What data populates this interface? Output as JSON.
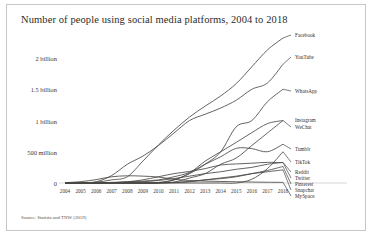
{
  "title": "Number of people using social media platforms, 2004 to 2018",
  "source": "Source: Statista and TNW (2019)",
  "chart_data": {
    "type": "line",
    "title": "Number of people using social media platforms, 2004 to 2018",
    "xlabel": "",
    "ylabel": "",
    "grid": false,
    "legend_position": "right-inline-labels",
    "xlim": [
      2004,
      2018
    ],
    "ylim": [
      0,
      2400
    ],
    "y_unit": "millions of users",
    "y_ticks": [
      0,
      500,
      1000,
      1500,
      2000
    ],
    "y_tick_labels": [
      "0",
      "500 million",
      "1 billion",
      "1.5 billion",
      "2 billion"
    ],
    "x": [
      2004,
      2005,
      2006,
      2007,
      2008,
      2009,
      2010,
      2011,
      2012,
      2013,
      2014,
      2015,
      2016,
      2017,
      2018
    ],
    "x_tick_labels": [
      "2004",
      "2005",
      "2006",
      "2007",
      "2008",
      "2009",
      "2010",
      "2011",
      "2012",
      "2013",
      "2014",
      "2015",
      "2016",
      "2017",
      "2018"
    ],
    "series": [
      {
        "name": "Facebook",
        "values": [
          0,
          6,
          12,
          50,
          100,
          350,
          608,
          845,
          1056,
          1230,
          1393,
          1591,
          1860,
          2129,
          2320
        ]
      },
      {
        "name": "YouTube",
        "values": [
          0,
          0,
          20,
          120,
          300,
          430,
          600,
          800,
          1000,
          1100,
          1200,
          1325,
          1500,
          1600,
          1900
        ]
      },
      {
        "name": "WhatsApp",
        "values": [
          0,
          0,
          0,
          0,
          0,
          0,
          10,
          50,
          150,
          300,
          500,
          900,
          1000,
          1300,
          1500
        ]
      },
      {
        "name": "Instagram",
        "values": [
          0,
          0,
          0,
          0,
          0,
          0,
          1,
          15,
          80,
          150,
          300,
          400,
          600,
          800,
          1000
        ]
      },
      {
        "name": "WeChat",
        "values": [
          0,
          0,
          0,
          0,
          0,
          0,
          0,
          50,
          160,
          350,
          500,
          650,
          806,
          950,
          1000
        ]
      },
      {
        "name": "Tumblr",
        "values": [
          0,
          0,
          0,
          10,
          20,
          30,
          50,
          100,
          170,
          300,
          420,
          555,
          550,
          500,
          620
        ]
      },
      {
        "name": "TikTok",
        "values": [
          0,
          0,
          0,
          0,
          0,
          0,
          0,
          0,
          0,
          0,
          0,
          0,
          60,
          230,
          500
        ]
      },
      {
        "name": "Reddit",
        "values": [
          0,
          0,
          0,
          5,
          10,
          20,
          40,
          70,
          110,
          150,
          180,
          220,
          250,
          300,
          330
        ]
      },
      {
        "name": "Twitter",
        "values": [
          0,
          0,
          0,
          5,
          20,
          50,
          100,
          150,
          185,
          230,
          288,
          305,
          317,
          330,
          326
        ]
      },
      {
        "name": "Pinterest",
        "values": [
          0,
          0,
          0,
          0,
          0,
          0,
          2,
          10,
          25,
          50,
          70,
          100,
          150,
          200,
          265
        ]
      },
      {
        "name": "Snapchat",
        "values": [
          0,
          0,
          0,
          0,
          0,
          0,
          0,
          5,
          20,
          50,
          80,
          110,
          150,
          180,
          210
        ]
      },
      {
        "name": "MySpace",
        "values": [
          5,
          22,
          54,
          100,
          115,
          110,
          95,
          60,
          40,
          30,
          25,
          20,
          15,
          12,
          10
        ]
      }
    ]
  }
}
